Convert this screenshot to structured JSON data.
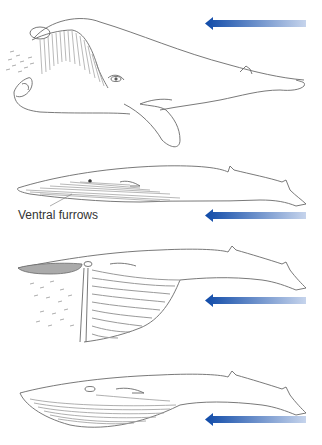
{
  "figure": {
    "panels": [
      {
        "id": "right-whale",
        "description": "Skim-feeding whale with open mouth and baleen, water flowing in",
        "arrow_direction": "left"
      },
      {
        "id": "rorqual-closed",
        "description": "Rorqual whale with closed mouth showing ventral furrows",
        "arrow_direction": "left",
        "label": "Ventral furrows"
      },
      {
        "id": "rorqual-engulf",
        "description": "Rorqual whale engulfing prey with expanded throat pouch",
        "arrow_direction": "left"
      },
      {
        "id": "rorqual-after",
        "description": "Rorqual whale after engulfment, mouth closed, pouch distended",
        "arrow_direction": "left"
      }
    ],
    "caption_visible_text": ""
  },
  "colors": {
    "arrow_dark": "#0f4aa8",
    "arrow_light": "#c6d4ec",
    "outline": "#6a6a6a",
    "furrow": "#9a9a9a",
    "baleen": "#8a8a8a",
    "label_text": "#333333"
  }
}
